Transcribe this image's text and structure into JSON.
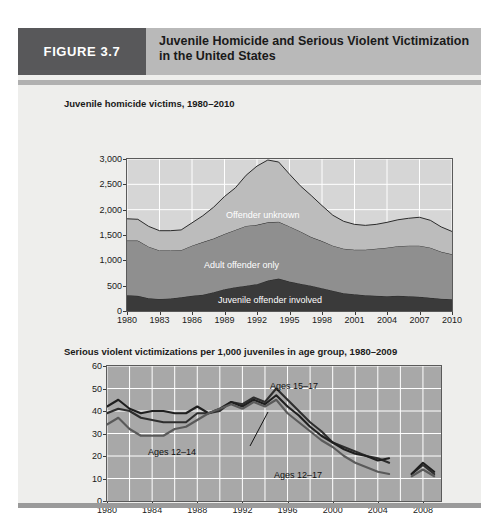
{
  "figure": {
    "badge": "FIGURE 3.7",
    "title_line1": "Juvenile Homicide and Serious Violent Victimization",
    "title_line2": "in the United States",
    "badge_color": "#58585a",
    "header_color": "#b9b9b9",
    "card_color": "#eeeeec"
  },
  "chart_data": [
    {
      "id": "juvenile-homicide-victims",
      "type": "area",
      "stacked": true,
      "title": "Juvenile homicide victims, 1980–2010",
      "xlabel": "",
      "ylabel": "",
      "xlim": [
        1980,
        2010
      ],
      "ylim": [
        0,
        3000
      ],
      "grid": true,
      "grid_color": "#ffffff",
      "plot_bg": "#d6d6d6",
      "ytick_labels": [
        "0",
        "500",
        "1,000",
        "1,500",
        "2,000",
        "2,500",
        "3,000"
      ],
      "ytick_values": [
        0,
        500,
        1000,
        1500,
        2000,
        2500,
        3000
      ],
      "xtick_labels": [
        "1980",
        "1983",
        "1986",
        "1989",
        "1992",
        "1995",
        "1998",
        "2001",
        "2004",
        "2007",
        "2010"
      ],
      "xtick_values": [
        1980,
        1983,
        1986,
        1989,
        1992,
        1995,
        1998,
        2001,
        2004,
        2007,
        2010
      ],
      "x": [
        1980,
        1981,
        1982,
        1983,
        1984,
        1985,
        1986,
        1987,
        1988,
        1989,
        1990,
        1991,
        1992,
        1993,
        1994,
        1995,
        1996,
        1997,
        1998,
        1999,
        2000,
        2001,
        2002,
        2003,
        2004,
        2005,
        2006,
        2007,
        2008,
        2009,
        2010
      ],
      "series": [
        {
          "name": "Juvenile offender involved",
          "label": "Juvenile offender involved",
          "color": "#3a3a3a",
          "values": [
            310,
            300,
            250,
            235,
            245,
            270,
            300,
            320,
            370,
            430,
            470,
            500,
            530,
            600,
            640,
            580,
            540,
            500,
            450,
            400,
            350,
            330,
            310,
            300,
            290,
            300,
            290,
            280,
            260,
            240,
            230
          ]
        },
        {
          "name": "Adult offender only",
          "label": "Adult offender only",
          "color": "#8f8f8f",
          "values": [
            1080,
            1090,
            1020,
            960,
            950,
            930,
            990,
            1040,
            1060,
            1090,
            1130,
            1180,
            1170,
            1150,
            1120,
            1090,
            1030,
            960,
            930,
            890,
            880,
            880,
            900,
            930,
            960,
            980,
            1000,
            1010,
            990,
            930,
            890
          ]
        },
        {
          "name": "Offender unknown",
          "label": "Offender unknown",
          "color": "#bcbcbc",
          "values": [
            430,
            420,
            400,
            390,
            390,
            400,
            450,
            520,
            620,
            740,
            830,
            1000,
            1160,
            1230,
            1180,
            1030,
            900,
            820,
            700,
            600,
            540,
            500,
            480,
            480,
            500,
            520,
            540,
            560,
            540,
            490,
            450
          ]
        }
      ],
      "totals": [
        1820,
        1810,
        1670,
        1585,
        1585,
        1600,
        1740,
        1880,
        2050,
        2260,
        2430,
        2680,
        2860,
        2980,
        2940,
        2700,
        2470,
        2280,
        2080,
        1890,
        1770,
        1710,
        1690,
        1710,
        1750,
        1800,
        1830,
        1850,
        1790,
        1660,
        1570
      ]
    },
    {
      "id": "serious-violent-victimizations",
      "type": "line",
      "title": "Serious violent victimizations per 1,000 juveniles in age group, 1980–2009",
      "xlabel": "",
      "ylabel": "",
      "xlim": [
        1980,
        2009
      ],
      "ylim": [
        0,
        60
      ],
      "grid": true,
      "grid_color": "#ffffff",
      "plot_bg": "#a8a8a8",
      "gap_note": "series break between 2005 and 2007; short segment drawn 2007-2009",
      "ytick_labels": [
        "0",
        "10",
        "20",
        "30",
        "40",
        "50",
        "60"
      ],
      "ytick_values": [
        0,
        10,
        20,
        30,
        40,
        50,
        60
      ],
      "xtick_labels": [
        "1980",
        "1984",
        "1988",
        "1992",
        "1996",
        "2000",
        "2004",
        "2008"
      ],
      "xtick_values": [
        1980,
        1984,
        1988,
        1992,
        1996,
        2000,
        2004,
        2008
      ],
      "x": [
        1980,
        1981,
        1982,
        1983,
        1984,
        1985,
        1986,
        1987,
        1988,
        1989,
        1990,
        1991,
        1992,
        1993,
        1994,
        1995,
        1996,
        1997,
        1998,
        1999,
        2000,
        2001,
        2002,
        2003,
        2004,
        2005
      ],
      "x_tail": [
        2007,
        2008,
        2009
      ],
      "series": [
        {
          "name": "Ages 15–17",
          "label": "Ages 15–17",
          "color": "#2e2e2e",
          "values": [
            39,
            41,
            40,
            37,
            36,
            35,
            35,
            35,
            39,
            39,
            40,
            44,
            43,
            46,
            44,
            50,
            45,
            40,
            35,
            31,
            26,
            24,
            22,
            20,
            19,
            17
          ],
          "tail_values": [
            12,
            16,
            12
          ]
        },
        {
          "name": "Ages 12–17",
          "label": "Ages 12–17",
          "color": "#1f1f1f",
          "values": [
            42,
            45,
            41,
            39,
            40,
            40,
            39,
            39,
            42,
            39,
            41,
            44,
            42,
            45,
            43,
            47,
            42,
            38,
            33,
            29,
            26,
            23,
            21,
            20,
            18,
            19
          ],
          "tail_values": [
            12,
            17,
            13
          ]
        },
        {
          "name": "Ages 12–14",
          "label": "Ages 12–14",
          "color": "#5a5a5a",
          "values": [
            34,
            37,
            32,
            29,
            29,
            29,
            32,
            33,
            36,
            39,
            41,
            43,
            41,
            44,
            42,
            45,
            39,
            35,
            31,
            27,
            24,
            20,
            17,
            15,
            13,
            12
          ],
          "tail_values": [
            11,
            14,
            11
          ]
        }
      ],
      "annotations": [
        {
          "text": "Ages 15–17",
          "x_px": 252,
          "y_px": 353
        },
        {
          "text": "Ages 12–14",
          "x_px": 130,
          "y_px": 419
        },
        {
          "text": "Ages 12–17",
          "x_px": 256,
          "y_px": 442
        }
      ]
    }
  ]
}
